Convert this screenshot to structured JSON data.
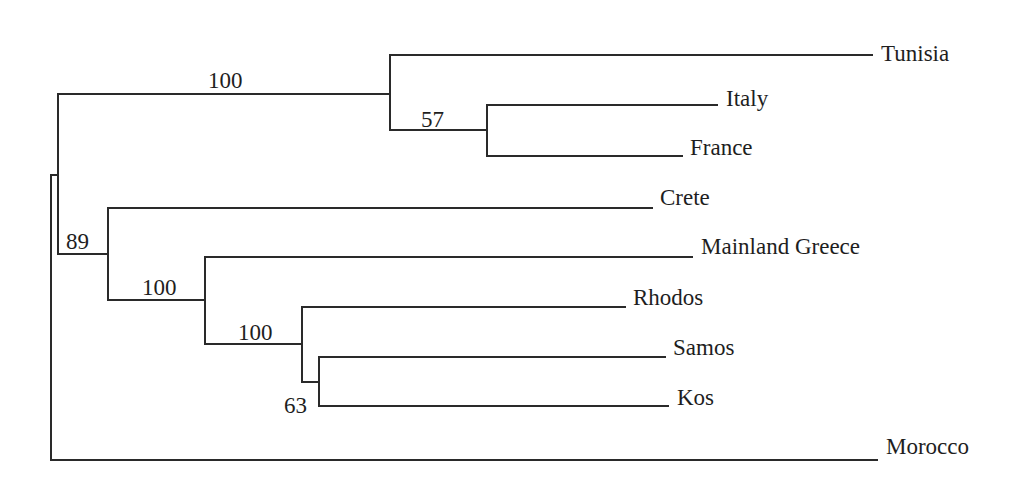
{
  "figure": {
    "type": "phylogenetic-tree",
    "orientation": "rectangular-left-to-right",
    "taxa": [
      {
        "name": "Tunisia",
        "y": 53,
        "x_end": 872
      },
      {
        "name": "Italy",
        "y": 97,
        "x_end": 717
      },
      {
        "name": "France",
        "y": 155,
        "x_end": 682
      },
      {
        "name": "Crete",
        "y": 206,
        "x_end": 652
      },
      {
        "name": "Mainland Greece",
        "y": 255,
        "x_end": 692
      },
      {
        "name": "Rhodos",
        "y": 305,
        "x_end": 625
      },
      {
        "name": "Samos",
        "y": 356,
        "x_end": 665
      },
      {
        "name": "Kos",
        "y": 405,
        "x_end": 668
      },
      {
        "name": "Morocco",
        "y": 455,
        "x_end": 877
      }
    ],
    "support_values": [
      {
        "node": "tunisia-italy-france",
        "value": "100",
        "x": 208,
        "y": 86
      },
      {
        "node": "italy-france",
        "value": "57",
        "x": 421,
        "y": 125
      },
      {
        "name_hint": "greek-clade",
        "node": "greek-clade",
        "value": "89",
        "x": 66,
        "y": 249
      },
      {
        "node": "mainland-rhodos-samos-kos",
        "value": "100",
        "x": 142,
        "y": 295
      },
      {
        "node": "rhodos-samos-kos",
        "value": "100",
        "x": 238,
        "y": 340
      },
      {
        "node": "samos-kos",
        "value": "63",
        "x": 284,
        "y": 413
      }
    ],
    "newick": "(((Tunisia,(Italy,France)57)100,(Crete,(Mainland Greece,(Rhodos,(Samos,Kos)63)100)100)89),Morocco);"
  },
  "colors": {
    "background": "#ffffff",
    "branch": "#2a2a2a",
    "text": "#1e1e1e"
  }
}
